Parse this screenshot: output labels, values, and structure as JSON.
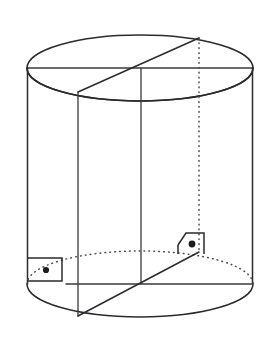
{
  "figure": {
    "title": "Cylinder with two perpendicular cross-section planes",
    "type": "geometric-solid-diagram",
    "shape": "cylinder",
    "background_color": "#ffffff",
    "line_color": "#2b2b2f",
    "hidden_line_color": "#4a4a50",
    "hidden_line_style": "dotted",
    "canvas": {
      "width": 277,
      "height": 346
    },
    "labels": [],
    "annotations": [
      {
        "name": "right-angle-left",
        "symbol": "right-angle-with-dot",
        "meaning": "perpendicular",
        "x": 47,
        "y": 271
      },
      {
        "name": "right-angle-right",
        "symbol": "right-angle-with-dot",
        "meaning": "perpendicular",
        "x": 191,
        "y": 249
      }
    ],
    "geometry": {
      "top_ellipse": {
        "cx": 140,
        "cy": 68,
        "rx": 113,
        "ry": 33
      },
      "bottom_ellipse": {
        "cx": 140,
        "cy": 284,
        "rx": 113,
        "ry": 33
      },
      "height": 216,
      "left_edge_x": 27,
      "right_edge_x": 253,
      "center_vertical_x": 141,
      "chord_vertical_x": 78,
      "hidden_vertical_x": 199
    }
  }
}
